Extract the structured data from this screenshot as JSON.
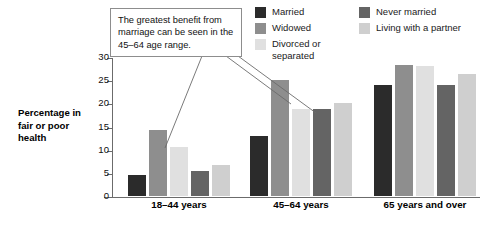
{
  "callout": {
    "text": "The greatest benefit from marriage can be seen in the 45–64 age range."
  },
  "axis": {
    "y_label": "Percentage in fair or poor health"
  },
  "legend": {
    "columns": [
      {
        "items": [
          {
            "label": "Married",
            "color": "#2b2b2b"
          },
          {
            "label": "Widowed",
            "color": "#8e8e8e"
          },
          {
            "label": "Divorced or\nseparated",
            "color": "#e0e0e0"
          }
        ]
      },
      {
        "items": [
          {
            "label": "Never married",
            "color": "#646464"
          },
          {
            "label": "Living with a partner",
            "color": "#cfcfcf"
          }
        ]
      }
    ]
  },
  "chart_data": {
    "type": "bar",
    "title": "",
    "xlabel": "",
    "ylabel": "Percentage in fair or poor health",
    "ylim": [
      0,
      30
    ],
    "yticks": [
      0,
      5,
      10,
      15,
      20,
      25,
      30
    ],
    "grid": false,
    "legend_position": "top-right",
    "categories": [
      "18–44 years",
      "45–64 years",
      "65 years and over"
    ],
    "series": [
      {
        "name": "Married",
        "color": "#2b2b2b",
        "values": [
          4.6,
          13.0,
          24.0
        ]
      },
      {
        "name": "Widowed",
        "color": "#8e8e8e",
        "values": [
          14.2,
          25.0,
          28.3
        ]
      },
      {
        "name": "Divorced or separated",
        "color": "#e0e0e0",
        "values": [
          10.6,
          18.8,
          28.0
        ]
      },
      {
        "name": "Never married",
        "color": "#646464",
        "values": [
          5.4,
          18.8,
          24.0
        ]
      },
      {
        "name": "Living with a partner",
        "color": "#cfcfcf",
        "values": [
          6.8,
          20.0,
          26.3
        ]
      }
    ]
  }
}
